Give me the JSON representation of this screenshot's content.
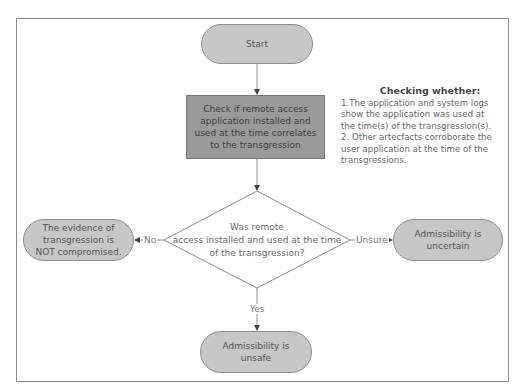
{
  "diagram": {
    "nodes": {
      "start": {
        "label": "Start",
        "shape": "terminator"
      },
      "check": {
        "label": "Check if remote access application installed and used at the time correlates to the transgression",
        "shape": "process"
      },
      "decision": {
        "label": "Was remote access installed and used at the time of the transgression?",
        "label_lines": [
          "Was remote",
          "access installed and used at the time",
          "of the transgression?"
        ],
        "shape": "decision"
      },
      "not_compromised": {
        "label_lines": [
          "The evidence of",
          "transgression is",
          "NOT compromised."
        ],
        "shape": "terminator"
      },
      "uncertain": {
        "label_lines": [
          "Admissibility is",
          "uncertain"
        ],
        "shape": "terminator"
      },
      "unsafe": {
        "label_lines": [
          "Admissibility is",
          "unsafe"
        ],
        "shape": "terminator"
      }
    },
    "edges": [
      {
        "from": "start",
        "to": "check",
        "label": ""
      },
      {
        "from": "check",
        "to": "decision",
        "label": ""
      },
      {
        "from": "decision",
        "to": "not_compromised",
        "label": "No"
      },
      {
        "from": "decision",
        "to": "uncertain",
        "label": "Unsure"
      },
      {
        "from": "decision",
        "to": "unsafe",
        "label": "Yes"
      }
    ],
    "note": {
      "title": "Checking whether:",
      "lines": [
        "1.The application and system logs",
        "show the application was used at",
        "the time(s) of the transgression(s).",
        "2. Other artecfacts corroborate the",
        "user application at the time of the",
        "transgressions."
      ]
    },
    "colors": {
      "terminator_fill": "#c7c7c7",
      "process_fill": "#9a9a9a",
      "line": "#8a8a8a"
    }
  }
}
